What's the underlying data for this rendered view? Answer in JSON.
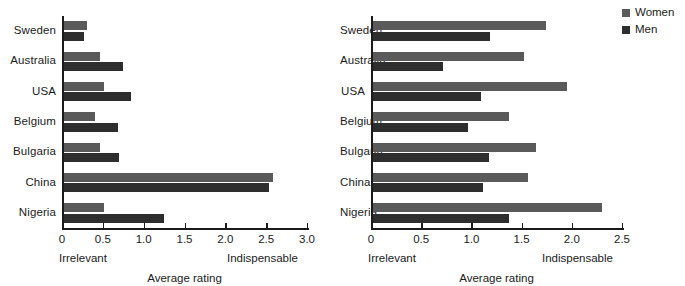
{
  "legend": {
    "entries": [
      {
        "label": "Women",
        "color": "#5a5a5a"
      },
      {
        "label": "Men",
        "color": "#2e2e2e"
      }
    ]
  },
  "chart_data": [
    {
      "type": "bar",
      "orientation": "horizontal",
      "panel": "left",
      "title": "",
      "xlabel": "Average rating",
      "ylabel": "",
      "xlim": [
        0,
        3.0
      ],
      "xticks": [
        0,
        0.5,
        1.0,
        1.5,
        2.0,
        2.5,
        3.0
      ],
      "xticklabels": [
        "0",
        "0.5",
        "1.0",
        "1.5",
        "2.0",
        "2.5",
        "3.0"
      ],
      "grid": false,
      "anchor_low": "Irrelevant",
      "anchor_high": "Indispensable",
      "categories": [
        "Sweden",
        "Australia",
        "USA",
        "Belgium",
        "Bulgaria",
        "China",
        "Nigeria"
      ],
      "series": [
        {
          "name": "Women",
          "color": "#5a5a5a",
          "values": [
            0.29,
            0.45,
            0.5,
            0.38,
            0.45,
            2.57,
            0.5
          ]
        },
        {
          "name": "Men",
          "color": "#2e2e2e",
          "values": [
            0.25,
            0.73,
            0.83,
            0.67,
            0.68,
            2.51,
            1.23
          ]
        }
      ]
    },
    {
      "type": "bar",
      "orientation": "horizontal",
      "panel": "right",
      "title": "",
      "xlabel": "Average rating",
      "ylabel": "",
      "xlim": [
        0,
        2.5
      ],
      "xticks": [
        0,
        0.5,
        1.0,
        1.5,
        2.0,
        2.5
      ],
      "xticklabels": [
        "0",
        "0.5",
        "1.0",
        "1.5",
        "2.0",
        "2.5"
      ],
      "grid": false,
      "anchor_low": "Irrelevant",
      "anchor_high": "Indispensable",
      "categories": [
        "Sweden",
        "Australia",
        "USA",
        "Belgium",
        "Bulgaria",
        "China",
        "Nigeria"
      ],
      "series": [
        {
          "name": "Women",
          "color": "#5a5a5a",
          "values": [
            1.73,
            1.51,
            1.94,
            1.36,
            1.63,
            1.55,
            2.28
          ]
        },
        {
          "name": "Men",
          "color": "#2e2e2e",
          "values": [
            1.17,
            0.7,
            1.08,
            0.95,
            1.16,
            1.1,
            1.36
          ]
        }
      ]
    }
  ]
}
